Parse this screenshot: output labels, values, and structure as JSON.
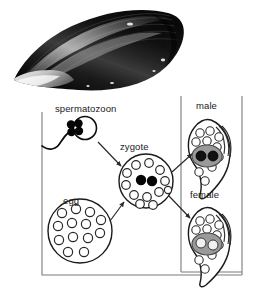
{
  "figure": {
    "title_text": "",
    "background_color": "#ffffff"
  },
  "photo": {
    "name": "mussel-shell-photograph",
    "subject": "mussel shell",
    "description": "black and white photograph of a dark mussel shell in side view",
    "colors": {
      "shell_dark": "#141414",
      "shell_mid": "#3a3a3a",
      "shell_highlight": "#e8e8e8",
      "background": "#ffffff"
    }
  },
  "diagram": {
    "name": "mussel-life-cycle-diagram",
    "type": "life-cycle",
    "frame": {
      "main_border_color": "#7a7a7a",
      "inner_border_color": "#7a7a7a"
    },
    "labels": {
      "spermatozoon": "spermatozoon",
      "zygote": "zygote",
      "egg": "egg",
      "male": "male",
      "female": "female"
    },
    "nodes": [
      {
        "id": "spermatozoon",
        "label": "spermatozoon",
        "shape": "round head with flagellum tail",
        "chromosomes": 4,
        "chromosome_color": "#000000",
        "outline_color": "#000000"
      },
      {
        "id": "egg",
        "label": "egg",
        "shape": "large circle",
        "vesicles": 13,
        "vesicle_fill": "#ffffff",
        "outline_color": "#1a1a1a"
      },
      {
        "id": "zygote",
        "label": "zygote",
        "shape": "circle",
        "vesicles": 12,
        "nuclei": 2,
        "nucleus_color": "#000000",
        "outline_color": "#1a1a1a"
      },
      {
        "id": "male",
        "label": "male",
        "shape": "comma / teardrop body",
        "gonad_fill": "#9a9a9a",
        "gonad_cells": 2,
        "gonad_cell_fill": "#1a1a1a",
        "vesicles": 10,
        "outline_color": "#1a1a1a"
      },
      {
        "id": "female",
        "label": "female",
        "shape": "comma / teardrop body",
        "gonad_fill": "#9a9a9a",
        "gonad_cells": 2,
        "gonad_cell_fill": "#efefef",
        "vesicles": 10,
        "outline_color": "#1a1a1a"
      }
    ],
    "arrows": [
      {
        "id": "sperm-to-zygote",
        "from": "spermatozoon",
        "to": "zygote",
        "direction": "down-right"
      },
      {
        "id": "egg-to-zygote",
        "from": "egg",
        "to": "zygote",
        "direction": "up-right"
      },
      {
        "id": "zygote-to-male",
        "from": "zygote",
        "to": "male",
        "direction": "up-right"
      },
      {
        "id": "zygote-to-female",
        "from": "zygote",
        "to": "female",
        "direction": "down-right"
      }
    ]
  }
}
